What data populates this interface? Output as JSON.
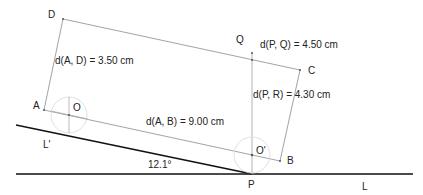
{
  "diagram": {
    "points": {
      "A": "A",
      "B": "B",
      "C": "C",
      "D": "D",
      "O": "O",
      "O_prime": "O'",
      "P": "P",
      "Q": "Q",
      "L": "L",
      "L_prime": "L'"
    },
    "measurements": {
      "AD": "d(A, D) = 3.50 cm",
      "AB": "d(A, B) = 9.00 cm",
      "PQ": "d(P, Q) = 4.50 cm",
      "PR": "d(P, R) = 4.30 cm"
    },
    "angle": "12.1°",
    "colors": {
      "thick_line": "#111111",
      "thin_line": "#999999",
      "circle": "#dddddd"
    }
  }
}
